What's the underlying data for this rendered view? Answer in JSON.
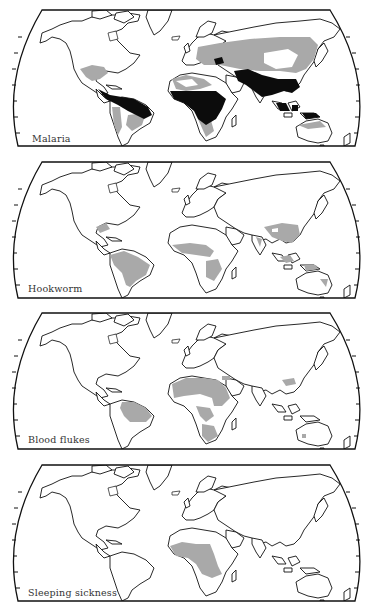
{
  "figure": {
    "panels": [
      {
        "id": "malaria",
        "label": "Malaria",
        "top": 7
      },
      {
        "id": "hookworm",
        "label": "Hookworm",
        "top": 159
      },
      {
        "id": "blood-flukes",
        "label": "Blood flukes",
        "top": 310
      },
      {
        "id": "sleeping-sickness",
        "label": "Sleeping sickness",
        "top": 462
      }
    ],
    "colors": {
      "outline": "#111111",
      "endemic_grey": "#a9a9a9",
      "high_risk_black": "#0c0c0c",
      "background": "#ffffff"
    }
  }
}
